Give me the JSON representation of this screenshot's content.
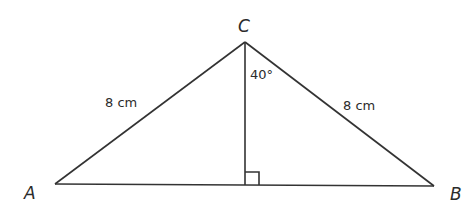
{
  "diagram": {
    "type": "isosceles triangle with altitude",
    "vertices": {
      "A": {
        "label": "A",
        "x": 55,
        "y": 184
      },
      "B": {
        "label": "B",
        "x": 434,
        "y": 186
      },
      "C": {
        "label": "C",
        "x": 245,
        "y": 42
      }
    },
    "altitude_foot": {
      "x": 245,
      "y": 185
    },
    "labels": {
      "vertex_a": "A",
      "vertex_b": "B",
      "vertex_c": "C",
      "side_ac": "8 cm",
      "side_bc": "8 cm",
      "angle_at_c": "40°"
    },
    "right_angle_marker": true,
    "line_color": "#333333"
  }
}
